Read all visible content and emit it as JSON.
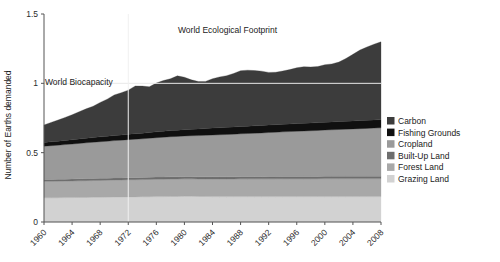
{
  "chart_data": {
    "type": "area",
    "title": "",
    "xlabel": "",
    "ylabel": "Number of Earths demanded",
    "xlim": [
      1960,
      2008
    ],
    "ylim": [
      0,
      1.5
    ],
    "yticks": [
      "0",
      "0.5",
      "1",
      "1.5"
    ],
    "ytick_values": [
      0,
      0.5,
      1,
      1.5
    ],
    "xticks": [
      "1960",
      "1964",
      "1968",
      "1972",
      "1976",
      "1980",
      "1984",
      "1988",
      "1992",
      "1996",
      "2000",
      "2004",
      "2008"
    ],
    "xtick_values": [
      1960,
      1964,
      1968,
      1972,
      1976,
      1980,
      1984,
      1988,
      1992,
      1996,
      2000,
      2004,
      2008
    ],
    "grid": true,
    "legend_position": "right",
    "stacking_order_bottom_to_top": [
      "Grazing Land",
      "Forest Land",
      "Built-Up Land",
      "Cropland",
      "Fishing Grounds",
      "Carbon"
    ],
    "annotations": [
      {
        "text": "World Ecological Footprint",
        "x": 1984,
        "y": 1.41
      },
      {
        "text": "World Biocapacity",
        "x": 1961,
        "y": 1.06
      }
    ],
    "reference_lines": [
      {
        "label": "World Biocapacity",
        "y": 1.0,
        "orientation": "horizontal"
      },
      {
        "label": "1972",
        "x": 1972,
        "orientation": "vertical"
      }
    ],
    "x": [
      1960,
      1961,
      1962,
      1963,
      1964,
      1965,
      1966,
      1967,
      1968,
      1969,
      1970,
      1971,
      1972,
      1973,
      1974,
      1975,
      1976,
      1977,
      1978,
      1979,
      1980,
      1981,
      1982,
      1983,
      1984,
      1985,
      1986,
      1987,
      1988,
      1989,
      1990,
      1991,
      1992,
      1993,
      1994,
      1995,
      1996,
      1997,
      1998,
      1999,
      2000,
      2001,
      2002,
      2003,
      2004,
      2005,
      2006,
      2007,
      2008
    ],
    "series": [
      {
        "name": "Grazing Land",
        "color": "#d2d2d2",
        "values": [
          0.175,
          0.175,
          0.175,
          0.176,
          0.176,
          0.177,
          0.177,
          0.178,
          0.178,
          0.179,
          0.18,
          0.18,
          0.181,
          0.181,
          0.182,
          0.182,
          0.183,
          0.183,
          0.184,
          0.184,
          0.185,
          0.185,
          0.184,
          0.184,
          0.183,
          0.183,
          0.183,
          0.183,
          0.183,
          0.183,
          0.183,
          0.183,
          0.183,
          0.183,
          0.183,
          0.183,
          0.183,
          0.183,
          0.183,
          0.183,
          0.183,
          0.183,
          0.183,
          0.183,
          0.183,
          0.183,
          0.183,
          0.183,
          0.183
        ]
      },
      {
        "name": "Forest Land",
        "color": "#a8a8a8",
        "values": [
          0.118,
          0.118,
          0.119,
          0.119,
          0.12,
          0.12,
          0.121,
          0.121,
          0.122,
          0.122,
          0.123,
          0.123,
          0.124,
          0.124,
          0.124,
          0.125,
          0.125,
          0.125,
          0.126,
          0.126,
          0.126,
          0.126,
          0.126,
          0.126,
          0.127,
          0.127,
          0.127,
          0.127,
          0.128,
          0.128,
          0.128,
          0.128,
          0.128,
          0.128,
          0.129,
          0.129,
          0.129,
          0.129,
          0.129,
          0.129,
          0.13,
          0.13,
          0.13,
          0.13,
          0.13,
          0.13,
          0.13,
          0.13,
          0.13
        ]
      },
      {
        "name": "Built-Up Land",
        "color": "#6e6e6e",
        "values": [
          0.014,
          0.014,
          0.014,
          0.014,
          0.014,
          0.015,
          0.015,
          0.015,
          0.015,
          0.015,
          0.015,
          0.015,
          0.015,
          0.015,
          0.015,
          0.015,
          0.016,
          0.016,
          0.016,
          0.016,
          0.016,
          0.016,
          0.016,
          0.016,
          0.016,
          0.016,
          0.016,
          0.016,
          0.016,
          0.016,
          0.016,
          0.016,
          0.017,
          0.017,
          0.017,
          0.017,
          0.017,
          0.017,
          0.017,
          0.017,
          0.017,
          0.017,
          0.017,
          0.017,
          0.017,
          0.017,
          0.017,
          0.017,
          0.017
        ]
      },
      {
        "name": "Cropland",
        "color": "#9a9a9a",
        "values": [
          0.24,
          0.243,
          0.246,
          0.249,
          0.252,
          0.255,
          0.258,
          0.261,
          0.264,
          0.266,
          0.269,
          0.272,
          0.274,
          0.277,
          0.279,
          0.282,
          0.284,
          0.287,
          0.289,
          0.291,
          0.293,
          0.295,
          0.297,
          0.299,
          0.301,
          0.303,
          0.305,
          0.307,
          0.309,
          0.311,
          0.313,
          0.315,
          0.317,
          0.319,
          0.321,
          0.323,
          0.325,
          0.327,
          0.329,
          0.331,
          0.333,
          0.335,
          0.337,
          0.339,
          0.341,
          0.343,
          0.345,
          0.347,
          0.349
        ]
      },
      {
        "name": "Fishing Grounds",
        "color": "#101010",
        "values": [
          0.027,
          0.028,
          0.029,
          0.03,
          0.031,
          0.032,
          0.033,
          0.034,
          0.035,
          0.036,
          0.037,
          0.038,
          0.039,
          0.04,
          0.04,
          0.041,
          0.042,
          0.043,
          0.044,
          0.045,
          0.046,
          0.047,
          0.048,
          0.049,
          0.05,
          0.051,
          0.052,
          0.052,
          0.053,
          0.053,
          0.054,
          0.054,
          0.054,
          0.055,
          0.055,
          0.055,
          0.056,
          0.056,
          0.056,
          0.057,
          0.057,
          0.057,
          0.058,
          0.058,
          0.058,
          0.059,
          0.059,
          0.059,
          0.06
        ]
      },
      {
        "name": "Carbon",
        "color": "#3c3c3c",
        "values": [
          0.126,
          0.14,
          0.152,
          0.166,
          0.18,
          0.196,
          0.212,
          0.226,
          0.248,
          0.268,
          0.292,
          0.304,
          0.318,
          0.344,
          0.34,
          0.33,
          0.352,
          0.366,
          0.374,
          0.392,
          0.378,
          0.356,
          0.342,
          0.34,
          0.356,
          0.366,
          0.372,
          0.386,
          0.402,
          0.404,
          0.398,
          0.392,
          0.38,
          0.378,
          0.384,
          0.392,
          0.402,
          0.408,
          0.404,
          0.404,
          0.414,
          0.418,
          0.428,
          0.452,
          0.48,
          0.508,
          0.528,
          0.546,
          0.56
        ]
      }
    ]
  },
  "axis": {
    "ylabel": "Number of Earths demanded"
  },
  "legend": {
    "items": [
      {
        "label": "Carbon",
        "color": "#3c3c3c"
      },
      {
        "label": "Fishing Grounds",
        "color": "#101010"
      },
      {
        "label": "Cropland",
        "color": "#9a9a9a"
      },
      {
        "label": "Built-Up Land",
        "color": "#6e6e6e"
      },
      {
        "label": "Forest Land",
        "color": "#a8a8a8"
      },
      {
        "label": "Grazing Land",
        "color": "#d2d2d2"
      }
    ]
  },
  "annotations": {
    "footprint": "World Ecological Footprint",
    "biocapacity": "World Biocapacity"
  }
}
